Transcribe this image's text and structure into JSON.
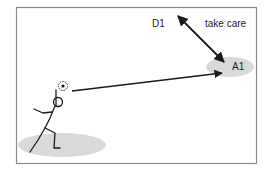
{
  "labels": {
    "defender": "D1",
    "attacker": "A1",
    "note": "take care"
  },
  "elements": {
    "passer": "stick-figure player with ball",
    "pass_direction": "from passer to A1",
    "pressure_direction": "two-way arrow between D1 and A1"
  },
  "colors": {
    "frame": "#8a8a8a",
    "zone": "#d9d9d9",
    "ink": "#1a1a1a",
    "background": "#ffffff"
  }
}
